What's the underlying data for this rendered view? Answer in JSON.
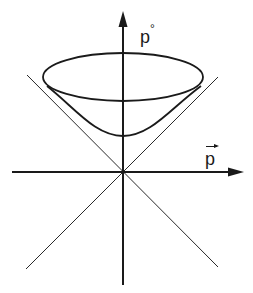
{
  "diagram": {
    "type": "mass-shell hyperboloid with light cone",
    "axes": {
      "vertical_label": "p",
      "vertical_superscript": "°",
      "horizontal_label": "p",
      "horizontal_vector_arrow": true
    },
    "elements": [
      "vertical energy axis p° with arrowhead",
      "horizontal momentum axis p (vector) with arrowhead",
      "two diagonal light-cone lines crossing at origin",
      "upper hyperboloid sheet (mass shell) with elliptical rim"
    ],
    "colors": {
      "ink": "#1a1a1a",
      "background": "#ffffff"
    }
  }
}
